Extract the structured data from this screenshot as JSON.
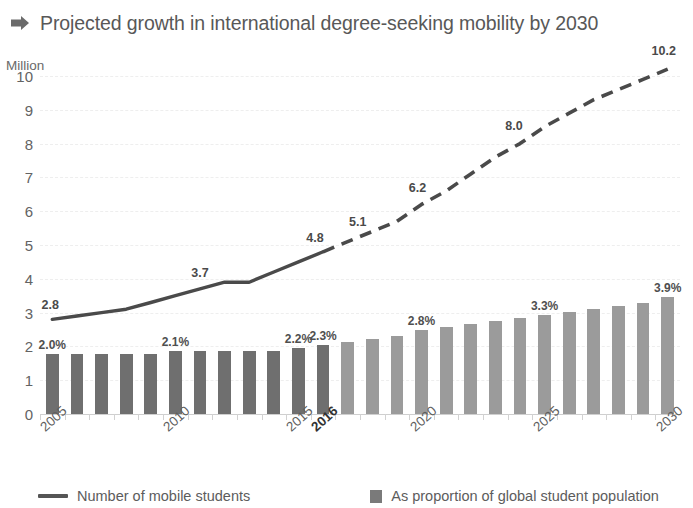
{
  "header": {
    "title": "Projected growth in international degree-seeking mobility by 2030",
    "arrow_icon": "arrow-right-icon"
  },
  "chart_data": {
    "type": "bar",
    "title": "Projected growth in international degree-seeking mobility by 2030",
    "xlabel": "",
    "ylabel": "Million",
    "ylim": [
      0,
      10
    ],
    "yticks": [
      "0",
      "1",
      "2",
      "3",
      "4",
      "5",
      "6",
      "7",
      "8",
      "9",
      "10"
    ],
    "grid": true,
    "legend_position": "bottom",
    "x": [
      2005,
      2006,
      2007,
      2008,
      2009,
      2010,
      2011,
      2012,
      2013,
      2014,
      2015,
      2016,
      2017,
      2018,
      2019,
      2020,
      2021,
      2022,
      2023,
      2024,
      2025,
      2026,
      2027,
      2028,
      2029,
      2030
    ],
    "xtick_labels": [
      "2005",
      "2010",
      "2015",
      "2016",
      "2020",
      "2025",
      "2030"
    ],
    "xtick_positions": [
      2005,
      2010,
      2015,
      2016,
      2020,
      2025,
      2030
    ],
    "xtick_bold": [
      "2016"
    ],
    "series": [
      {
        "name": "Number of mobile students",
        "type": "line",
        "unit": "Million",
        "actual_through": 2016,
        "values": [
          2.8,
          2.9,
          3.0,
          3.1,
          3.3,
          3.5,
          3.7,
          3.9,
          3.9,
          4.2,
          4.5,
          4.8,
          5.1,
          5.4,
          5.7,
          6.2,
          6.6,
          7.1,
          7.6,
          8.0,
          8.5,
          8.9,
          9.3,
          9.6,
          9.9,
          10.2
        ],
        "labels": [
          {
            "year": 2005,
            "text": "2.8"
          },
          {
            "year": 2011,
            "text": "3.7"
          },
          {
            "year": 2016,
            "text": "4.8"
          },
          {
            "year": 2017,
            "text": "5.1"
          },
          {
            "year": 2020,
            "text": "6.2"
          },
          {
            "year": 2024,
            "text": "8.0"
          },
          {
            "year": 2030,
            "text": "10.2"
          }
        ]
      },
      {
        "name": "As proportion of global student population",
        "type": "bar",
        "unit": "%",
        "actual_through": 2016,
        "values": [
          2.0,
          2.0,
          2.0,
          2.0,
          2.0,
          2.1,
          2.1,
          2.1,
          2.1,
          2.1,
          2.2,
          2.3,
          2.4,
          2.5,
          2.6,
          2.8,
          2.9,
          3.0,
          3.1,
          3.2,
          3.3,
          3.4,
          3.5,
          3.6,
          3.7,
          3.9
        ],
        "labels": [
          {
            "year": 2005,
            "text": "2.0%"
          },
          {
            "year": 2010,
            "text": "2.1%"
          },
          {
            "year": 2015,
            "text": "2.2%"
          },
          {
            "year": 2016,
            "text": "2.3%"
          },
          {
            "year": 2020,
            "text": "2.8%"
          },
          {
            "year": 2025,
            "text": "3.3%"
          },
          {
            "year": 2030,
            "text": "3.9%"
          }
        ]
      }
    ],
    "colors": {
      "bar_actual": "#6f6f6f",
      "bar_projected": "#9b9b9b",
      "line": "#4a4a4a",
      "grid": "#f0f0f0",
      "text": "#5d5d5d"
    }
  },
  "legend": {
    "line_label": "Number of mobile students",
    "bar_label": "As proportion of global student population"
  }
}
